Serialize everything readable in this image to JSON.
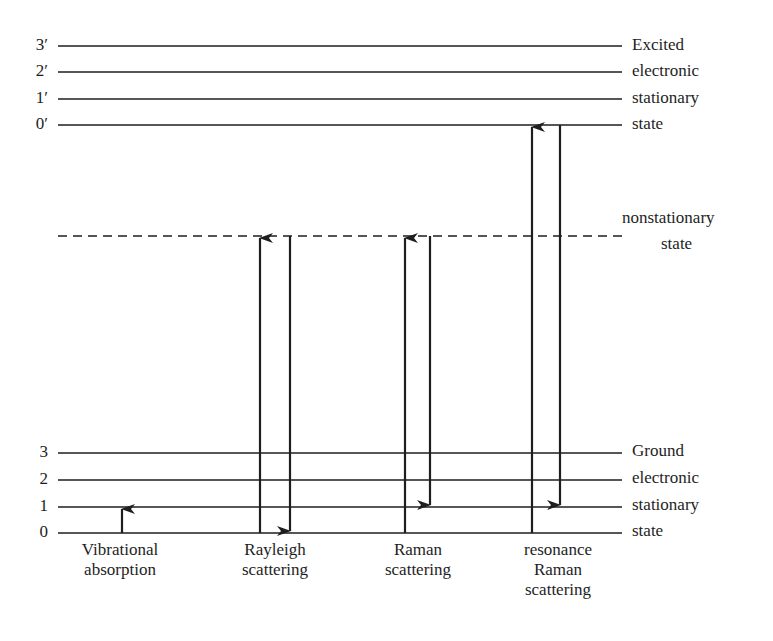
{
  "diagram": {
    "line_color": "#1e1e1e",
    "excited_state": {
      "levels": [
        {
          "label": "3′",
          "y": 46,
          "side_label": "Excited"
        },
        {
          "label": "2′",
          "y": 72,
          "side_label": "electronic"
        },
        {
          "label": "1′",
          "y": 99,
          "side_label": "stationary"
        },
        {
          "label": "0′",
          "y": 125,
          "side_label": "state"
        }
      ]
    },
    "nonstationary_state": {
      "y": 236,
      "label_line1": "nonstationary",
      "label_line2": "state",
      "style": "dashed"
    },
    "ground_state": {
      "levels": [
        {
          "label": "3",
          "y": 453,
          "side_label": "Ground"
        },
        {
          "label": "2",
          "y": 480,
          "side_label": "electronic"
        },
        {
          "label": "1",
          "y": 507,
          "side_label": "stationary"
        },
        {
          "label": "0",
          "y": 533,
          "side_label": "state"
        }
      ]
    },
    "processes": [
      {
        "name": "Vibrational absorption",
        "caption": [
          "Vibrational",
          "absorption"
        ],
        "arrows": [
          {
            "direction": "up",
            "x": 122,
            "from": "0",
            "to": "1"
          }
        ]
      },
      {
        "name": "Rayleigh scattering",
        "caption": [
          "Rayleigh",
          "scattering"
        ],
        "arrows": [
          {
            "direction": "up",
            "x": 260,
            "from": "0",
            "to": "nonstationary"
          },
          {
            "direction": "down",
            "x": 290,
            "from": "nonstationary",
            "to": "0"
          }
        ]
      },
      {
        "name": "Raman scattering",
        "caption": [
          "Raman",
          "scattering"
        ],
        "arrows": [
          {
            "direction": "up",
            "x": 405,
            "from": "0",
            "to": "nonstationary"
          },
          {
            "direction": "down",
            "x": 430,
            "from": "nonstationary",
            "to": "1"
          }
        ]
      },
      {
        "name": "resonance Raman scattering",
        "caption": [
          "resonance",
          "Raman",
          "scattering"
        ],
        "arrows": [
          {
            "direction": "up",
            "x": 532,
            "from": "0",
            "to": "0′"
          },
          {
            "direction": "down",
            "x": 560,
            "from": "0′",
            "to": "1"
          }
        ]
      }
    ]
  },
  "labels": {
    "ex3": "3′",
    "ex2": "2′",
    "ex1": "1′",
    "ex0": "0′",
    "gr3": "3",
    "gr2": "2",
    "gr1": "1",
    "gr0": "0",
    "excited": "Excited",
    "excited_electronic": "electronic",
    "excited_stationary": "stationary",
    "excited_state": "state",
    "nonstationary": "nonstationary",
    "nonstationary_state": "state",
    "ground": "Ground",
    "ground_electronic": "electronic",
    "ground_stationary": "stationary",
    "ground_state": "state",
    "cap_vib_1": "Vibrational",
    "cap_vib_2": "absorption",
    "cap_ray_1": "Rayleigh",
    "cap_ray_2": "scattering",
    "cap_ram_1": "Raman",
    "cap_ram_2": "scattering",
    "cap_res_1": "resonance",
    "cap_res_2": "Raman",
    "cap_res_3": "scattering"
  }
}
